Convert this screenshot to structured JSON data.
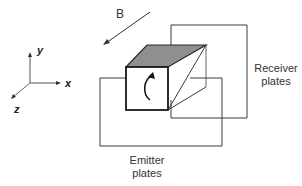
{
  "diagram": {
    "field_label": "B",
    "axes": {
      "y": "y",
      "x": "x",
      "z": "z"
    },
    "receiver_label": [
      "Receiver",
      "plates"
    ],
    "emitter_label": [
      "Emitter",
      "plates"
    ],
    "colors": {
      "line": "#2a2a2a",
      "top_face": "#8f8f8f",
      "axis": "#555555"
    }
  }
}
